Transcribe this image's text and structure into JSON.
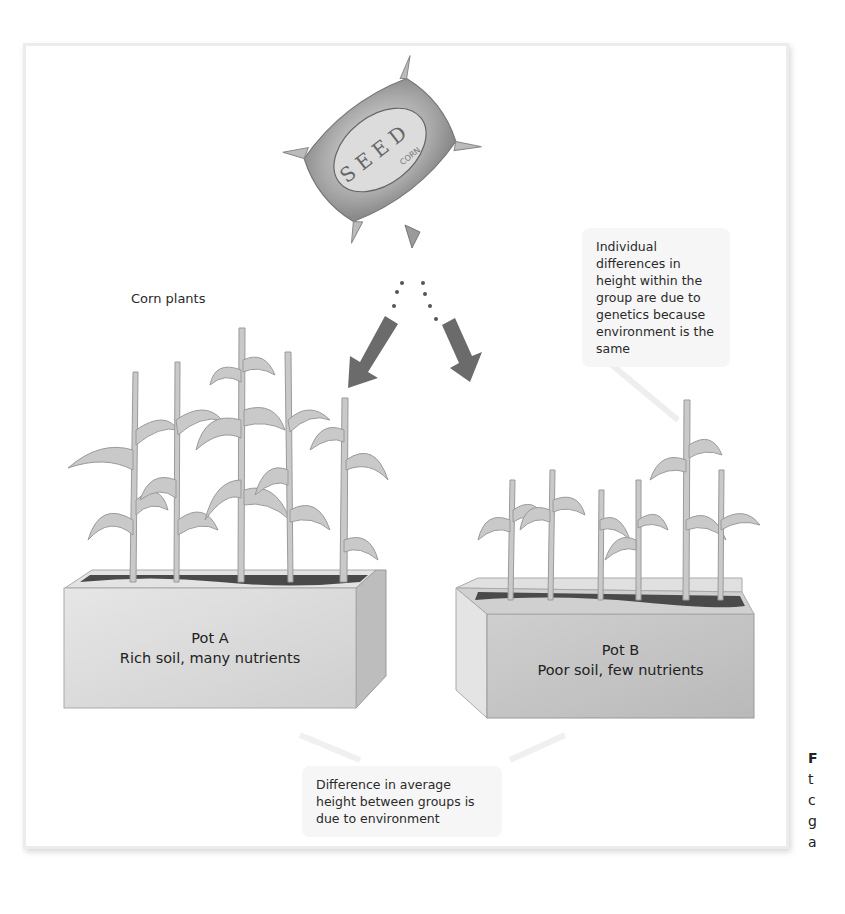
{
  "diagram": {
    "seed_bag": {
      "label": "SEED",
      "sublabel": "CORN"
    },
    "labels": {
      "corn_plants": "Corn plants"
    },
    "callouts": {
      "genetics": "Individual differences in height within the group are due to genetics because environment is the same",
      "environment": "Difference in average height between groups is due to environment"
    },
    "pots": [
      {
        "name": "Pot A",
        "description": "Rich soil, many nutrients"
      },
      {
        "name": "Pot B",
        "description": "Poor soil, few nutrients"
      }
    ],
    "caption_fragment": {
      "lines": [
        "F",
        "t",
        "c",
        "g",
        "a"
      ]
    },
    "colors": {
      "arrow": "#6b6b6b",
      "pot_a_face": "#d9d9d9",
      "pot_b_face": "#c4c4c4",
      "soil": "#4a4a4a",
      "plant": "#bdbdbd"
    }
  }
}
